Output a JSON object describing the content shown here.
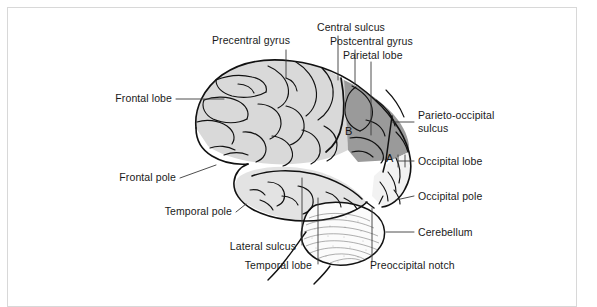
{
  "figure": {
    "border_color": "#d8d8d8",
    "background": "#ffffff"
  },
  "palette": {
    "outline": "#111111",
    "frontal_fill": "#d9d9d9",
    "parietal_fill": "#9a9a9a",
    "occipital_fill": "#f2f2f2",
    "temporal_fill": "#e3e3e3",
    "cerebellum_fill": "#fbfbfb",
    "leader_line": "#3a3a3a",
    "text": "#1a1a1a"
  },
  "labels": {
    "precentral_gyrus": "Precentral gyrus",
    "central_sulcus": "Central sulcus",
    "postcentral_gyrus": "Postcentral gyrus",
    "parietal_lobe": "Parietal lobe",
    "frontal_lobe": "Frontal lobe",
    "parieto_occipital_sulcus_line1": "Parieto-occipital",
    "parieto_occipital_sulcus_line2": "sulcus",
    "occipital_lobe": "Occipital lobe",
    "frontal_pole": "Frontal pole",
    "occipital_pole": "Occipital pole",
    "temporal_pole": "Temporal pole",
    "cerebellum": "Cerebellum",
    "lateral_sulcus": "Lateral sulcus",
    "temporal_lobe": "Temporal lobe",
    "preoccipital_notch": "Preoccipital notch"
  },
  "markers": {
    "marker_a": "A",
    "marker_b": "B"
  }
}
